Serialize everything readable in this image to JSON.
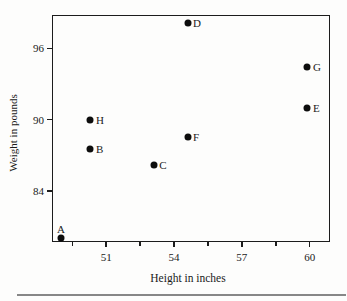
{
  "chart_data": {
    "type": "scatter",
    "title": "",
    "xlabel": "Height in inches",
    "ylabel": "Weight in pounds",
    "xlim": [
      48.6,
      60.9
    ],
    "ylim": [
      79.7,
      98.8
    ],
    "x_ticks": [
      51,
      54,
      57,
      60
    ],
    "x_minor_ticks": [
      49.5,
      52.5,
      55.5,
      58.5
    ],
    "y_ticks": [
      84,
      90,
      96
    ],
    "grid": false,
    "legend": "none",
    "point_color": "#0d0d0d",
    "points": [
      {
        "label": "A",
        "x": 49.0,
        "y": 80.0,
        "label_pos": "above"
      },
      {
        "label": "B",
        "x": 50.3,
        "y": 87.5,
        "label_pos": "right"
      },
      {
        "label": "C",
        "x": 53.1,
        "y": 86.2,
        "label_pos": "right"
      },
      {
        "label": "D",
        "x": 54.6,
        "y": 98.1,
        "label_pos": "right"
      },
      {
        "label": "E",
        "x": 59.9,
        "y": 91.0,
        "label_pos": "right"
      },
      {
        "label": "F",
        "x": 54.6,
        "y": 88.5,
        "label_pos": "right"
      },
      {
        "label": "G",
        "x": 59.9,
        "y": 94.4,
        "label_pos": "right"
      },
      {
        "label": "H",
        "x": 50.3,
        "y": 90.0,
        "label_pos": "right"
      }
    ]
  }
}
